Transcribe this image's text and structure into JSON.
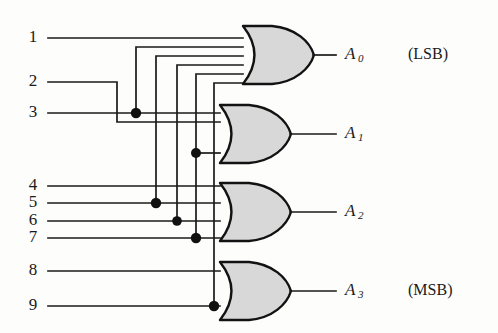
{
  "diagram": {
    "background_color": "#fdfdfc",
    "wire_color": "#1a1a1a",
    "gate_fill_color": "#d8d8d8",
    "gate_stroke_color": "#121212",
    "junction_color": "#111111"
  },
  "inputs": [
    {
      "id": "in-1",
      "label": "1",
      "x": 33,
      "y": 38,
      "line_y": 38
    },
    {
      "id": "in-2",
      "label": "2",
      "x": 33,
      "y": 82,
      "line_y": 82
    },
    {
      "id": "in-3",
      "label": "3",
      "x": 33,
      "y": 113,
      "line_y": 113
    },
    {
      "id": "in-4",
      "label": "4",
      "x": 33,
      "y": 186,
      "line_y": 186
    },
    {
      "id": "in-5",
      "label": "5",
      "x": 33,
      "y": 203,
      "line_y": 203
    },
    {
      "id": "in-6",
      "label": "6",
      "x": 33,
      "y": 221,
      "line_y": 221
    },
    {
      "id": "in-7",
      "label": "7",
      "x": 33,
      "y": 238,
      "line_y": 238
    },
    {
      "id": "in-8",
      "label": "8",
      "x": 33,
      "y": 271,
      "line_y": 271
    },
    {
      "id": "in-9",
      "label": "9",
      "x": 33,
      "y": 306,
      "line_y": 306
    }
  ],
  "gates": [
    {
      "id": "gate-a0",
      "type": "OR",
      "x": 243,
      "y": 26,
      "width": 65,
      "height": 58,
      "input_count": 5
    },
    {
      "id": "gate-a1",
      "type": "OR",
      "x": 220,
      "y": 105,
      "width": 65,
      "height": 58,
      "input_count": 4
    },
    {
      "id": "gate-a2",
      "type": "OR",
      "x": 220,
      "y": 183,
      "width": 65,
      "height": 58,
      "input_count": 4
    },
    {
      "id": "gate-a3",
      "type": "OR",
      "x": 220,
      "y": 262,
      "width": 65,
      "height": 58,
      "input_count": 2
    }
  ],
  "outputs": [
    {
      "id": "out-a0",
      "label": "A",
      "subscript": "0",
      "note": "(LSB)",
      "x": 345,
      "y": 55,
      "note_x": 408
    },
    {
      "id": "out-a1",
      "label": "A",
      "subscript": "1",
      "note": "",
      "x": 345,
      "y": 134,
      "note_x": 408
    },
    {
      "id": "out-a2",
      "label": "A",
      "subscript": "2",
      "note": "",
      "x": 345,
      "y": 212,
      "note_x": 408
    },
    {
      "id": "out-a3",
      "label": "A",
      "subscript": "3",
      "note": "(MSB)",
      "x": 345,
      "y": 291,
      "note_x": 408
    }
  ],
  "junctions": [
    {
      "id": "junction-3",
      "x": 136,
      "y": 113
    },
    {
      "id": "junction-5",
      "x": 156,
      "y": 203
    },
    {
      "id": "junction-6",
      "x": 177,
      "y": 221
    },
    {
      "id": "junction-7",
      "x": 196,
      "y": 238
    },
    {
      "id": "junction-9",
      "x": 214,
      "y": 306
    },
    {
      "id": "junction-mid",
      "x": 196,
      "y": 153
    }
  ],
  "risers": [
    {
      "id": "riser-3",
      "x": 136,
      "from_y": 113,
      "to_y": 47
    },
    {
      "id": "riser-5",
      "x": 156,
      "from_y": 203,
      "to_y": 56
    },
    {
      "id": "riser-6",
      "x": 177,
      "from_y": 221,
      "to_y": 65
    },
    {
      "id": "riser-7",
      "x": 196,
      "from_y": 238,
      "to_y": 74
    },
    {
      "id": "riser-9",
      "x": 214,
      "from_y": 306,
      "to_y": 83
    }
  ]
}
